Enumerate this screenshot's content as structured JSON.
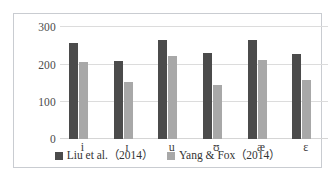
{
  "chart_data": {
    "type": "bar",
    "title": "",
    "subtitle": "",
    "xlabel": "",
    "ylabel": "",
    "categories": [
      "i",
      "ɪ",
      "u",
      "ʊ",
      "æ",
      "ɛ"
    ],
    "series": [
      {
        "name": "Liu et al.（2014）",
        "color": "#4b4b4b",
        "values": [
          258,
          209,
          264,
          231,
          266,
          228
        ]
      },
      {
        "name": "Yang & Fox（2014）",
        "color": "#a8a8a8",
        "values": [
          206,
          153,
          222,
          144,
          212,
          158
        ]
      }
    ],
    "ylim": [
      0,
      300
    ],
    "yticks": [
      0,
      100,
      200,
      300
    ],
    "ytick_labels": [
      "0",
      "100",
      "200",
      "300"
    ],
    "grid": true,
    "legend_position": "bottom",
    "plot_border": true
  },
  "colors": {
    "series_a": "#4b4b4b",
    "series_b": "#a8a8a8",
    "gridline": "#dcdcdc",
    "frame": "#c9ccd1",
    "text": "#3d3d3d",
    "background": "#ffffff"
  }
}
